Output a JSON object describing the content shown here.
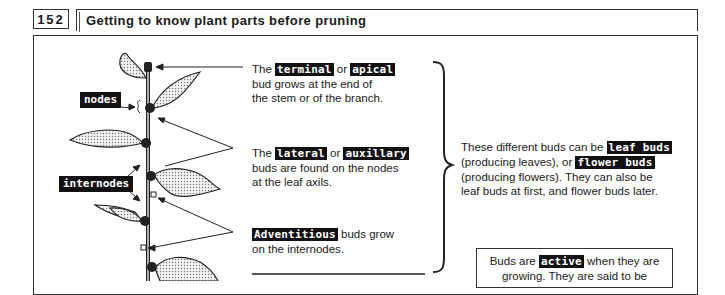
{
  "header": {
    "page_number": "152",
    "title": "Getting to know plant parts before pruning"
  },
  "diagram_labels": {
    "nodes": "nodes",
    "internodes": "internodes"
  },
  "terminal_block": {
    "prefix": "The",
    "term1": "terminal",
    "connector": "or",
    "term2": "apical",
    "line2": "bud grows at the end of",
    "line3": "the stem or of the branch."
  },
  "lateral_block": {
    "prefix": "The",
    "term1": "lateral",
    "connector": "or",
    "term2": "auxillary",
    "line2": "buds are found on the nodes",
    "line3": "at the leaf axils."
  },
  "adventitious_block": {
    "term": "Adventitious",
    "suffix": "buds grow",
    "line2": "on the internodes."
  },
  "summary_block": {
    "line1_prefix": "These different buds can be",
    "term1": "leaf buds",
    "line2_prefix": "(producing leaves), or",
    "term2": "flower buds",
    "line3": "(producing flowers). They can also be",
    "line4": "leaf buds at first, and flower buds later."
  },
  "active_box": {
    "prefix": "Buds are",
    "term": "active",
    "suffix": "when they are",
    "line2": "growing. They are said to be"
  },
  "colors": {
    "ink": "#111111",
    "border": "#333333",
    "leaf_fill": "#bdbdbd"
  }
}
